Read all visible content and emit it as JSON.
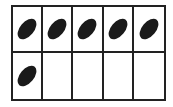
{
  "ten_frame": {
    "rows": 2,
    "columns": 5,
    "filled_count": 6,
    "cells": [
      {
        "row": 1,
        "col": 1,
        "content": "bean-icon"
      },
      {
        "row": 1,
        "col": 2,
        "content": "bean-icon"
      },
      {
        "row": 1,
        "col": 3,
        "content": "bean-icon"
      },
      {
        "row": 1,
        "col": 4,
        "content": "bean-icon"
      },
      {
        "row": 1,
        "col": 5,
        "content": "bean-icon"
      },
      {
        "row": 2,
        "col": 1,
        "content": "bean-icon"
      },
      {
        "row": 2,
        "col": 2,
        "content": ""
      },
      {
        "row": 2,
        "col": 3,
        "content": ""
      },
      {
        "row": 2,
        "col": 4,
        "content": ""
      },
      {
        "row": 2,
        "col": 5,
        "content": ""
      }
    ],
    "colors": {
      "border": "#222222",
      "bean": "#1a1a1a",
      "background": "#ffffff"
    }
  }
}
